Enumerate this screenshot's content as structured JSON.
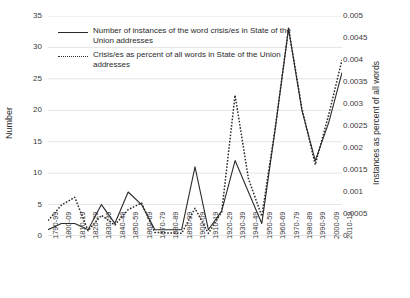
{
  "chart_data": {
    "type": "line",
    "title": "",
    "xlabel": "",
    "ylabel": "Number",
    "ylabel_right": "Instances as percent of all words",
    "grid": true,
    "legend_position": "top-left",
    "ylim": [
      0,
      35
    ],
    "ylim_right": [
      0,
      0.005
    ],
    "yticks": [
      "0",
      "5",
      "10",
      "15",
      "20",
      "25",
      "30",
      "35"
    ],
    "yticks_right": [
      "0",
      "0.0005",
      "0.001",
      "0.0015",
      "0.002",
      "0.0025",
      "0.003",
      "0.0035",
      "0.004",
      "0.0045",
      "0.005"
    ],
    "categories": [
      "1790-99",
      "1800-09",
      "1810-19",
      "1820-29",
      "1830-39",
      "1840-49",
      "1850-59",
      "1860-69",
      "1870-79",
      "1880-89",
      "1890-99",
      "1900-09",
      "1910-19",
      "1920-29",
      "1930-39",
      "1940-49",
      "1950-59",
      "1960-69",
      "1970-79",
      "1980-89",
      "1990-99",
      "2000-09",
      "2010-19"
    ],
    "series": [
      {
        "name": "Number of instances of the word crisis/es in State of the Union addresses",
        "axis": "left",
        "style": "solid",
        "values": [
          1,
          2,
          2,
          1,
          5,
          2,
          7,
          5,
          1,
          1,
          1,
          11,
          1,
          4,
          12,
          7,
          2,
          17,
          33,
          20,
          12,
          18,
          26
        ]
      },
      {
        "name": "Crisis/es as percent of all words in State of the Union addresses",
        "axis": "right",
        "style": "dotted",
        "values": [
          0.00035,
          0.0007,
          0.00088,
          0.00012,
          0.00047,
          0.00025,
          0.0006,
          0.00075,
          8e-05,
          7e-05,
          6e-05,
          0.00063,
          6e-05,
          0.00055,
          0.0032,
          0.0013,
          0.00045,
          0.00245,
          0.00472,
          0.0029,
          0.00162,
          0.00275,
          0.004
        ]
      }
    ]
  },
  "legend": {
    "entries": [
      {
        "key_icon": "solid-line-icon",
        "label": "Number of instances of the word crisis/es in State of the Union addresses"
      },
      {
        "key_icon": "dotted-line-icon",
        "label": "Crisis/es as percent of all words in State of the Union addresses"
      }
    ]
  },
  "colors": {
    "line": "#2b2b2b",
    "grid": "#d9d9d9",
    "text": "#3a3a3a",
    "background": "#ffffff"
  }
}
